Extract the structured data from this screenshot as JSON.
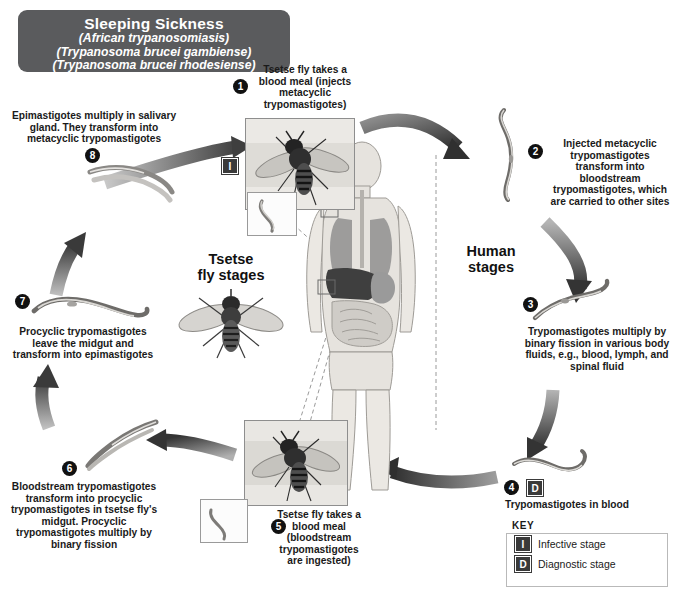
{
  "title": {
    "main": "Sleeping Sickness",
    "sub1": "(African trypanosomiasis)",
    "sub2": "(Trypanosoma brucei gambiense)",
    "sub3": "(Trypanosoma brucei rhodesiense)"
  },
  "stage_labels": {
    "vector": "Tsetse\nfly stages",
    "vector_line1": "Tsetse",
    "vector_line2": "fly stages",
    "host_line1": "Human",
    "host_line2": "stages"
  },
  "steps": [
    {
      "number": "1",
      "glyph": "❶",
      "text": "Tsetse fly takes a blood meal (injects metacyclic trypomastigotes)",
      "badge": "I",
      "badge_meaning": "Infective stage",
      "side": "vector"
    },
    {
      "number": "2",
      "glyph": "❷",
      "text": "Injected metacyclic trypomastigotes transform into bloodstream trypomastigotes, which are carried to other sites",
      "badge": "",
      "side": "human"
    },
    {
      "number": "3",
      "glyph": "❸",
      "text": "Trypomastigotes multiply by binary fission in various body fluids, e.g., blood, lymph, and spinal fluid",
      "badge": "",
      "side": "human"
    },
    {
      "number": "4",
      "glyph": "❹",
      "text": "Trypomastigotes in blood",
      "badge": "D",
      "badge_meaning": "Diagnostic stage",
      "side": "human"
    },
    {
      "number": "5",
      "glyph": "❺",
      "text": "Tsetse fly takes a blood meal (bloodstream trypomastigotes are ingested)",
      "badge": "",
      "side": "vector"
    },
    {
      "number": "6",
      "glyph": "❻",
      "text": "Bloodstream trypomastigotes transform into procyclic trypomastigotes in tsetse fly's midgut. Procyclic trypomastigotes multiply by binary fission",
      "badge": "",
      "side": "vector"
    },
    {
      "number": "7",
      "glyph": "❼",
      "text": "Procyclic trypomastigotes leave the midgut and transform into epimastigotes",
      "badge": "",
      "side": "vector"
    },
    {
      "number": "8",
      "glyph": "❽",
      "text": "Epimastigotes multiply in salivary gland. They transform into metacyclic trypomastigotes",
      "badge": "",
      "side": "vector"
    }
  ],
  "key": {
    "label": "KEY",
    "rows": [
      {
        "badge": "I",
        "text": "Infective stage"
      },
      {
        "badge": "D",
        "text": "Diagnostic stage"
      }
    ]
  },
  "colors": {
    "title_plaque": "#5a5b5d",
    "badge": "#3a3a3a",
    "bullet": "#111111",
    "arrow_dark": "#3f3f3f",
    "arrow_mid": "#7b7b7b",
    "background": "#ffffff"
  }
}
